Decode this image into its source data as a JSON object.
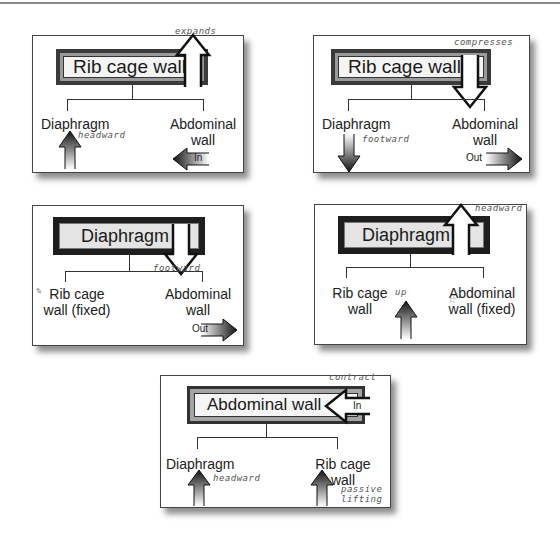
{
  "panels": [
    {
      "id": "p1",
      "header": "Rib cage wall",
      "left_label": "Diaphragm",
      "right_label": [
        "Abdominal",
        "wall"
      ],
      "header_note": "expands",
      "left_note": "headward",
      "right_arrow_label": "In",
      "header_arrow": "up",
      "left_arrow": "up",
      "right_arrow": "left"
    },
    {
      "id": "p2",
      "header": "Rib cage wall",
      "left_label": "Diaphragm",
      "right_label": [
        "Abdominal",
        "wall"
      ],
      "header_note": "compresses",
      "left_note": "footward",
      "right_arrow_label": "Out",
      "header_arrow": "down",
      "left_arrow": "down",
      "right_arrow": "right"
    },
    {
      "id": "p3",
      "header": "Diaphragm",
      "left_label": [
        "Rib cage",
        "wall (fixed)"
      ],
      "right_label": [
        "Abdominal",
        "wall"
      ],
      "header_note": "footward",
      "right_arrow_label": "Out",
      "header_arrow": "down",
      "right_arrow": "right"
    },
    {
      "id": "p4",
      "header": "Diaphragm",
      "left_label": [
        "Rib cage",
        "wall"
      ],
      "right_label": [
        "Abdominal",
        "wall (fixed)"
      ],
      "header_note": "headward",
      "left_note": "up",
      "header_arrow": "up",
      "left_arrow": "up"
    },
    {
      "id": "p5",
      "header": "Abdominal wall",
      "left_label": "Diaphragm",
      "right_label": [
        "Rib cage",
        "wall"
      ],
      "header_note": "contract",
      "header_arrow_label": "In",
      "left_note": "headward",
      "right_note": [
        "passive",
        "lifting"
      ],
      "header_arrow": "left",
      "left_arrow": "up",
      "right_arrow": "up"
    }
  ],
  "colors": {
    "panel_border": "#444444",
    "header_dark": "#1e1e1e",
    "header_mid": "#9a9a9a",
    "arrow_dark": "#111111",
    "handwriting": "#555555"
  }
}
